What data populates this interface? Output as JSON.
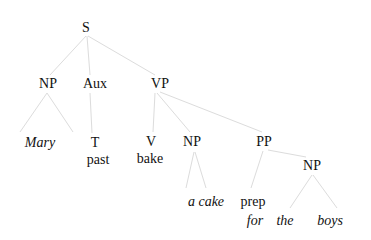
{
  "tree": {
    "root": "S",
    "edge_color": "#dcdcdc",
    "nodes": {
      "s": {
        "label": "S",
        "x": 86,
        "y": 28
      },
      "np1": {
        "label": "NP",
        "x": 48,
        "y": 84
      },
      "aux": {
        "label": "Aux",
        "x": 94,
        "y": 84
      },
      "vp": {
        "label": "VP",
        "x": 160,
        "y": 84
      },
      "mary": {
        "label": "Mary",
        "x": 40,
        "y": 143,
        "italic": true
      },
      "t": {
        "label": "T",
        "x": 95,
        "y": 143
      },
      "past": {
        "label": "past",
        "x": 98,
        "y": 160
      },
      "v": {
        "label": "V",
        "x": 151,
        "y": 142
      },
      "bake": {
        "label": "bake",
        "x": 150,
        "y": 159
      },
      "np2": {
        "label": "NP",
        "x": 192,
        "y": 142
      },
      "pp": {
        "label": "PP",
        "x": 264,
        "y": 142
      },
      "acake": {
        "label": "a cake",
        "x": 206,
        "y": 202,
        "italic": true
      },
      "np3": {
        "label": "NP",
        "x": 312,
        "y": 166
      },
      "prep": {
        "label": "prep",
        "x": 253,
        "y": 202
      },
      "for": {
        "label": "for",
        "x": 255,
        "y": 221,
        "italic": true
      },
      "the": {
        "label": "the",
        "x": 285,
        "y": 221,
        "italic": true
      },
      "boys": {
        "label": "boys",
        "x": 330,
        "y": 221,
        "italic": true
      }
    }
  }
}
